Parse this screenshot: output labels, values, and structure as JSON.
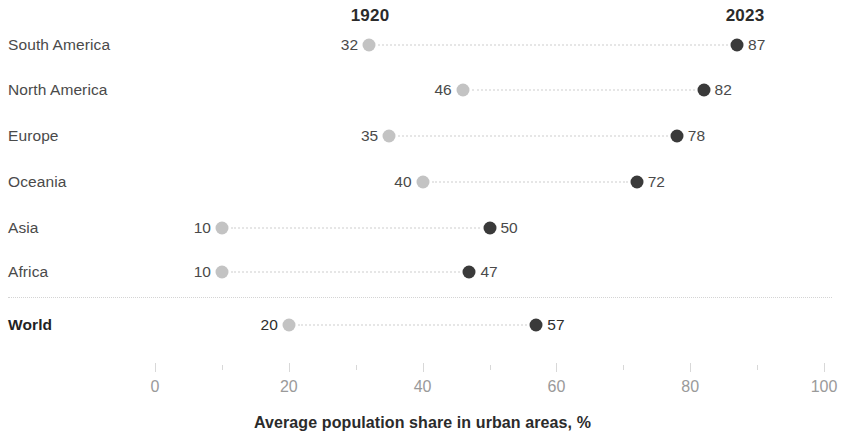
{
  "chart_data": {
    "type": "scatter",
    "subtype": "dumbbell-dot-plot",
    "title": "",
    "xlabel": "Average population share in urban areas, %",
    "ylabel": "",
    "xlim": [
      0,
      100
    ],
    "grid": false,
    "legend_position": "top-as-column-headers",
    "column_headers": [
      "1920",
      "2023"
    ],
    "series": [
      {
        "name": "1920",
        "color": "#c3c3c3",
        "values": [
          32,
          46,
          35,
          40,
          10,
          10,
          20
        ]
      },
      {
        "name": "2023",
        "color": "#3a3a3a",
        "values": [
          87,
          82,
          78,
          72,
          50,
          47,
          57
        ]
      }
    ],
    "categories": [
      "South America",
      "North America",
      "Europe",
      "Oceania",
      "Asia",
      "Africa",
      "World"
    ],
    "xticks": [
      0,
      20,
      40,
      60,
      80,
      100
    ],
    "xticks_labels": [
      "0",
      "20",
      "40",
      "60",
      "80",
      "100"
    ],
    "xticks_minor": [
      10,
      30,
      50,
      70,
      90
    ],
    "rows": [
      {
        "label": "South America",
        "start": 32,
        "end": 87,
        "start_label": "32",
        "end_label": "87",
        "total": false
      },
      {
        "label": "North America",
        "start": 46,
        "end": 82,
        "start_label": "46",
        "end_label": "82",
        "total": false
      },
      {
        "label": "Europe",
        "start": 35,
        "end": 78,
        "start_label": "35",
        "end_label": "78",
        "total": false
      },
      {
        "label": "Oceania",
        "start": 40,
        "end": 72,
        "start_label": "40",
        "end_label": "72",
        "total": false
      },
      {
        "label": "Asia",
        "start": 10,
        "end": 50,
        "start_label": "10",
        "end_label": "50",
        "total": false
      },
      {
        "label": "Africa",
        "start": 10,
        "end": 47,
        "start_label": "10",
        "end_label": "47",
        "total": false
      },
      {
        "label": "World",
        "start": 20,
        "end": 57,
        "start_label": "20",
        "end_label": "57",
        "total": true
      }
    ]
  },
  "colors": {
    "dot_1920": "#c3c3c3",
    "dot_2023": "#3a3a3a",
    "label_text": "#4a4a4a",
    "header_text": "#2b2b2b",
    "tick_label": "#9a9a9a",
    "separator": "#d4d4d4",
    "connector": "#e6e6e6"
  }
}
